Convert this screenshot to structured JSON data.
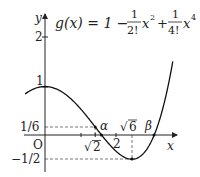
{
  "chart_data": {
    "type": "line",
    "function": "g(x) = 1 - x^2/2 + x^4/24",
    "xlabel": "x",
    "ylabel": "y",
    "origin_label": "O",
    "xlim": [
      -0.56,
      3.6
    ],
    "ylim": [
      -0.6,
      2.5
    ],
    "grid": false,
    "legend": null,
    "x_ticks": [
      {
        "value": 1,
        "label": ""
      },
      {
        "value": 1.41421,
        "label": "√2"
      },
      {
        "value": 2,
        "label": "2"
      }
    ],
    "y_ticks": [
      {
        "value": 2,
        "label": "2"
      },
      {
        "value": 1,
        "label": "1"
      },
      {
        "value": 0.16667,
        "label": "1/6"
      },
      {
        "value": -0.5,
        "label": "−1/2"
      }
    ],
    "annotations": [
      {
        "label": "α",
        "x": 1.592,
        "y": 0,
        "note": "root of g"
      },
      {
        "label": "√6",
        "x": 2.449,
        "y": -0.5,
        "note": "local minimum"
      },
      {
        "label": "β",
        "x": 3.076,
        "y": 0,
        "note": "root of g"
      },
      {
        "label": "1/6",
        "x": 1.41421,
        "y": 0.16667,
        "note": "g(√2) = 1/6"
      },
      {
        "label": "1",
        "x": 0,
        "y": 1,
        "note": "g(0) = 1, local maximum"
      }
    ],
    "guide_lines": [
      {
        "from": [
          0,
          0.16667
        ],
        "to": [
          1.41421,
          0.16667
        ],
        "style": "dashed"
      },
      {
        "from": [
          1.41421,
          0.16667
        ],
        "to": [
          1.41421,
          0
        ],
        "style": "dashed"
      },
      {
        "from": [
          0,
          -0.5
        ],
        "to": [
          2.449,
          -0.5
        ],
        "style": "dashed"
      },
      {
        "from": [
          2.449,
          -0.5
        ],
        "to": [
          2.449,
          0
        ],
        "style": "dashed"
      }
    ],
    "series": [
      {
        "name": "g(x)",
        "x": [
          -0.56,
          -0.25,
          0,
          0.25,
          0.5,
          0.75,
          1,
          1.25,
          1.41421,
          1.592,
          1.75,
          2,
          2.25,
          2.449,
          2.75,
          3,
          3.076,
          3.25,
          3.5,
          3.6
        ],
        "y": [
          0.847,
          0.969,
          1,
          0.969,
          0.878,
          0.732,
          0.542,
          0.321,
          0.167,
          0,
          -0.141,
          -0.333,
          -0.47,
          -0.5,
          -0.433,
          -0.125,
          0,
          0.289,
          1.129,
          1.518
        ]
      }
    ]
  },
  "labels": {
    "y_axis": "y",
    "x_axis": "x",
    "origin": "O",
    "tick_2": "2",
    "tick_1": "1",
    "tick_one_sixth": "1/6",
    "tick_neg_half": "−1/2",
    "tick_sqrt2_root": "√",
    "tick_sqrt2_arg": "2",
    "tick_x2": "2",
    "alpha": "α",
    "sqrt6_root": "√",
    "sqrt6_arg": "6",
    "beta": "β"
  },
  "formula": {
    "lhs": "g(x) = 1 −",
    "frac1_num": "1",
    "frac1_den": "2!",
    "term1": "x",
    "exp1": "2",
    "plus": "+",
    "frac2_num": "1",
    "frac2_den": "4!",
    "term2": "x",
    "exp2": "4"
  }
}
